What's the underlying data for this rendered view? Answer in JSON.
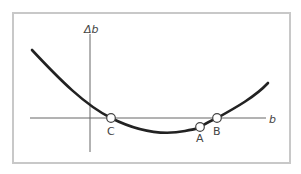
{
  "diagram": {
    "y_axis_label": "Δb",
    "x_axis_label": "b",
    "points": [
      {
        "name": "C",
        "label": "C"
      },
      {
        "name": "A",
        "label": "A"
      },
      {
        "name": "B",
        "label": "B"
      }
    ],
    "colors": {
      "curve": "#222222",
      "axis": "#666666",
      "frame": "#c8c8c8",
      "marker_fill": "#ffffff"
    }
  }
}
